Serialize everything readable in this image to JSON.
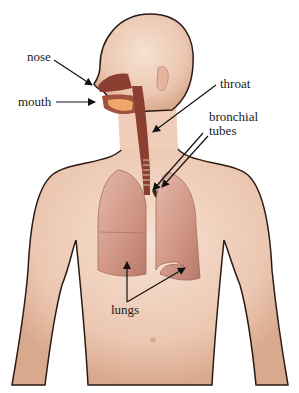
{
  "diagram": {
    "colors": {
      "skin": "#f0d2bf",
      "skin_shadow": "#d9a98e",
      "outline": "#2a1a14",
      "airway": "#8a3f30",
      "lung": "#c98a7a",
      "lung_light": "#e3b3a4",
      "mouth_inner": "#f0a56a",
      "label_text": "#1a1a1a",
      "arrow": "#111111"
    },
    "labels": {
      "nose": "nose",
      "mouth": "mouth",
      "throat": "throat",
      "bronchial_line1": "bronchial",
      "bronchial_line2": "tubes",
      "lungs": "lungs"
    }
  }
}
